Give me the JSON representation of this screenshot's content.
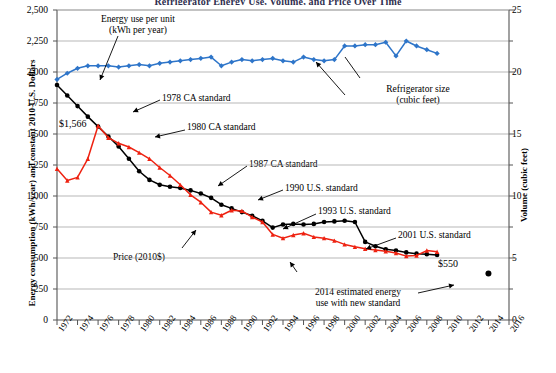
{
  "title": "Refrigerator Energy Use, Volume, and Price Over Time",
  "axes": {
    "left_title": "Energy consumption (kWh/year) and constant 2010 U.S. Dollars",
    "right_title": "Volume (cubic feet)",
    "left_ticks": [
      "0",
      "250",
      "500",
      "750",
      "1,000",
      "1,250",
      "1,500",
      "1,750",
      "2,000",
      "2,250",
      "2,500"
    ],
    "right_ticks": [
      "0",
      "5",
      "10",
      "15",
      "20",
      "25"
    ],
    "x_ticks": [
      "1972",
      "1974",
      "1976",
      "1978",
      "1980",
      "1982",
      "1984",
      "1986",
      "1988",
      "1990",
      "1992",
      "1994",
      "1996",
      "1998",
      "2000",
      "2002",
      "2004",
      "2006",
      "2008",
      "2010",
      "2012",
      "2014",
      "2016"
    ]
  },
  "annotations": {
    "energy_use": "Energy use per unit",
    "energy_use_sub": "(kWh per year)",
    "price_peak": "$1,566",
    "ca_1978": "1978 CA standard",
    "ca_1980": "1980 CA standard",
    "ca_1987": "1987 CA standard",
    "us_1990": "1990 U.S. standard",
    "us_1993": "1993 U.S. standard",
    "us_2001": "2001 U.S. standard",
    "fridge_size": "Refrigerator size",
    "fridge_size_sub": "(cubic feet)",
    "price_label": "Price (2010$)",
    "price_end": "$550",
    "est_2014": "2014 estimated energy",
    "est_2014_sub": "use with new standard"
  },
  "colors": {
    "energy": "#000000",
    "price": "#ee2211",
    "volume": "#2e75c9",
    "grid": "#9a9a9a",
    "axis": "#555555"
  },
  "chart_data": {
    "type": "line",
    "title": "Refrigerator Energy Use, Volume, and Price Over Time",
    "xlabel": "",
    "ylabel": "Energy consumption (kWh/year) and constant 2010 U.S. Dollars",
    "y2label": "Volume (cubic feet)",
    "xlim": [
      1972,
      2016
    ],
    "ylim": [
      0,
      2500
    ],
    "y2lim": [
      0,
      25
    ],
    "grid": true,
    "legend": "annotations-inline",
    "x": [
      1972,
      1973,
      1974,
      1975,
      1976,
      1977,
      1978,
      1979,
      1980,
      1981,
      1982,
      1983,
      1984,
      1985,
      1986,
      1987,
      1988,
      1989,
      1990,
      1991,
      1992,
      1993,
      1994,
      1995,
      1996,
      1997,
      1998,
      1999,
      2000,
      2001,
      2002,
      2003,
      2004,
      2005,
      2006,
      2007,
      2008,
      2009
    ],
    "series": [
      {
        "name": "Energy use per unit (kWh per year)",
        "axis": "left",
        "color": "#000000",
        "values": [
          1895,
          1810,
          1725,
          1640,
          1560,
          1480,
          1400,
          1300,
          1200,
          1130,
          1090,
          1075,
          1065,
          1045,
          1020,
          985,
          930,
          900,
          870,
          840,
          800,
          745,
          770,
          775,
          770,
          775,
          790,
          795,
          800,
          790,
          630,
          595,
          570,
          560,
          545,
          535,
          530,
          525
        ]
      },
      {
        "name": "Price (2010$)",
        "axis": "left",
        "color": "#ee2211",
        "values": [
          1220,
          1125,
          1150,
          1300,
          1566,
          1470,
          1425,
          1395,
          1350,
          1300,
          1230,
          1165,
          1090,
          1010,
          950,
          870,
          845,
          885,
          880,
          830,
          790,
          690,
          660,
          685,
          700,
          670,
          660,
          640,
          610,
          590,
          575,
          565,
          555,
          540,
          515,
          520,
          560,
          550
        ]
      },
      {
        "name": "Refrigerator size (cubic feet)",
        "axis": "right",
        "color": "#2e75c9",
        "values": [
          19.4,
          19.9,
          20.3,
          20.5,
          20.5,
          20.5,
          20.4,
          20.5,
          20.6,
          20.5,
          20.7,
          20.8,
          20.9,
          21.0,
          21.1,
          21.2,
          20.5,
          20.8,
          21.0,
          20.9,
          21.0,
          21.1,
          20.9,
          20.8,
          21.2,
          21.0,
          20.9,
          21.0,
          22.1,
          22.1,
          22.2,
          22.2,
          22.4,
          21.3,
          22.5,
          22.1,
          21.8,
          21.5
        ]
      }
    ],
    "extra_points": [
      {
        "name": "2014 estimated energy use with new standard",
        "x": 2014,
        "y": 375,
        "axis": "left",
        "color": "#000000"
      }
    ],
    "data_labels": [
      {
        "text": "$1,566",
        "x": 1975,
        "y": 1566,
        "series": "Price (2010$)"
      },
      {
        "text": "$550",
        "x": 2009,
        "y": 550,
        "series": "Price (2010$)"
      }
    ]
  }
}
